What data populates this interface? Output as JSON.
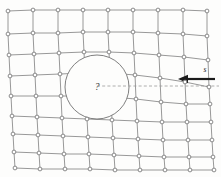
{
  "figure": {
    "background_color": "#fdfdfc",
    "width": 221,
    "height": 177
  },
  "lattice": {
    "edge_color": "#8c8c8c",
    "node_fill": "#ffffff",
    "node_stroke": "#6e6e6e",
    "node_radius": 1.9,
    "rows": 9,
    "cols": 9,
    "description": "distorted quadrilateral mesh",
    "points": [
      [
        [
          8,
          11
        ],
        [
          33,
          10
        ],
        [
          58,
          10
        ],
        [
          83,
          10
        ],
        [
          108,
          10
        ],
        [
          133,
          10
        ],
        [
          158,
          10
        ],
        [
          183,
          10
        ],
        [
          207,
          11
        ]
      ],
      [
        [
          8,
          34
        ],
        [
          33,
          33
        ],
        [
          58,
          33
        ],
        [
          83,
          32
        ],
        [
          108,
          32
        ],
        [
          133,
          32
        ],
        [
          158,
          33
        ],
        [
          183,
          34
        ],
        [
          207,
          36
        ]
      ],
      [
        [
          9,
          55
        ],
        [
          34,
          54
        ],
        [
          59,
          53
        ],
        [
          84,
          52
        ],
        [
          109,
          52
        ],
        [
          134,
          53
        ],
        [
          159,
          55
        ],
        [
          184,
          57
        ],
        [
          208,
          60
        ]
      ],
      [
        [
          10,
          76
        ],
        [
          35,
          75
        ],
        [
          60,
          74
        ],
        [
          85,
          73
        ],
        [
          110,
          73
        ],
        [
          135,
          75
        ],
        [
          160,
          78
        ],
        [
          185,
          82
        ],
        [
          209,
          87
        ]
      ],
      [
        [
          11,
          96
        ],
        [
          36,
          96
        ],
        [
          61,
          96
        ],
        [
          86,
          96
        ],
        [
          111,
          97
        ],
        [
          136,
          99
        ],
        [
          161,
          102
        ],
        [
          186,
          104
        ],
        [
          210,
          104
        ]
      ],
      [
        [
          12,
          116
        ],
        [
          37,
          117
        ],
        [
          62,
          118
        ],
        [
          87,
          119
        ],
        [
          112,
          120
        ],
        [
          137,
          121
        ],
        [
          162,
          122
        ],
        [
          187,
          122
        ],
        [
          211,
          122
        ]
      ],
      [
        [
          13,
          134
        ],
        [
          38,
          135
        ],
        [
          63,
          136
        ],
        [
          88,
          137
        ],
        [
          113,
          138
        ],
        [
          138,
          139
        ],
        [
          163,
          140
        ],
        [
          188,
          140
        ],
        [
          212,
          140
        ]
      ],
      [
        [
          14,
          152
        ],
        [
          39,
          153
        ],
        [
          64,
          154
        ],
        [
          89,
          154
        ],
        [
          114,
          155
        ],
        [
          139,
          156
        ],
        [
          164,
          157
        ],
        [
          189,
          157
        ],
        [
          213,
          157
        ]
      ],
      [
        [
          15,
          168
        ],
        [
          40,
          169
        ],
        [
          65,
          169
        ],
        [
          90,
          169
        ],
        [
          115,
          170
        ],
        [
          140,
          170
        ],
        [
          165,
          170
        ],
        [
          190,
          170
        ],
        [
          214,
          170
        ]
      ]
    ]
  },
  "inclusion": {
    "label": "?",
    "cx": 97,
    "cy": 87,
    "r": 32,
    "fill": "#fdfdfc",
    "stroke": "#707070"
  },
  "reference_line": {
    "name": "horizontal-dashed-reference",
    "x1": 97,
    "x2": 219,
    "y": 86,
    "color": "#9a9a9a",
    "dash": "3 2.2"
  },
  "load": {
    "label": "s",
    "direction": "left",
    "color": "#1b1b1b",
    "tail_x": 215,
    "tip_x": 178,
    "y": 79,
    "label_x": 205,
    "label_y": 72
  }
}
